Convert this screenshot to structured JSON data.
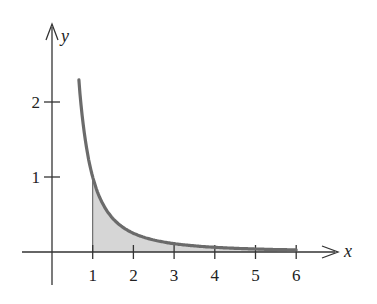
{
  "chart_data": {
    "type": "area",
    "title": "",
    "function": "y = 1/x^2",
    "xlabel": "x",
    "ylabel": "y",
    "x_ticks": [
      "1",
      "2",
      "3",
      "4",
      "5",
      "6"
    ],
    "y_ticks": [
      "1",
      "2"
    ],
    "xlim": [
      -0.7,
      7.3
    ],
    "ylim": [
      -0.4,
      3.3
    ],
    "curve_x_range": [
      0.66,
      6
    ],
    "shaded_region": {
      "x_from": 1,
      "x_to": 6,
      "description": "area under y=1/x^2 from x=1 to x=6"
    },
    "grid": false,
    "colors": {
      "curve": "#6b6b6b",
      "fill": "#d6d6d6",
      "axes": "#333333"
    }
  }
}
